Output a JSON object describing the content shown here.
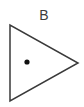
{
  "figure": {
    "kind": "geometric-diagram",
    "width": 84,
    "height": 107,
    "background_color": "#ffffff",
    "label": "B",
    "label_color": "#3c3c3c",
    "label_center": {
      "x": 44,
      "y": 16
    },
    "stroke_color": "#3a3a3a",
    "stroke_width": 1.5,
    "fill": "none",
    "shapes": [
      {
        "name": "triangle",
        "type": "polygon",
        "orientation": "points-right",
        "points": "10,25 10,101 78,63",
        "vertices": [
          {
            "label": "top-left",
            "x": 10,
            "y": 25
          },
          {
            "label": "bottom-left",
            "x": 10,
            "y": 101
          },
          {
            "label": "right-apex",
            "x": 78,
            "y": 63
          }
        ],
        "stroke_color": "#3a3a3a",
        "stroke_width": 1.5,
        "fill": "none"
      },
      {
        "name": "interior-point",
        "type": "dot",
        "center": {
          "x": 27,
          "y": 62
        },
        "radius": 2.6,
        "fill_color": "#111111"
      }
    ]
  }
}
